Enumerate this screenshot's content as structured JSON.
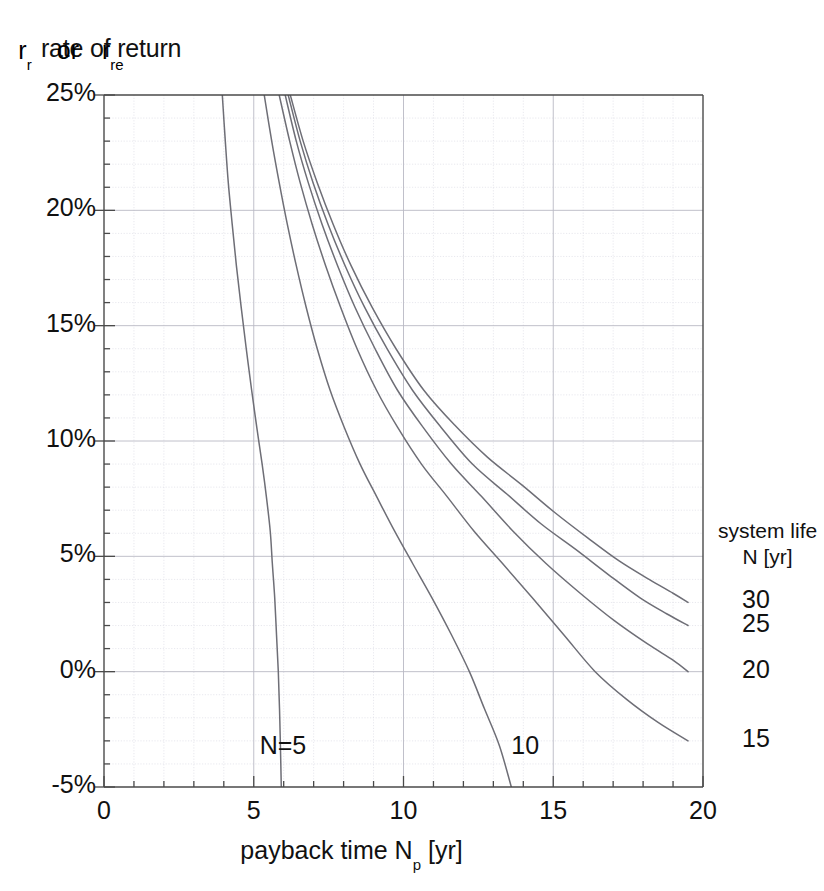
{
  "axes": {
    "ylabel_line1": "rate of return",
    "ylabel_or": "or",
    "ylabel_r": "r",
    "ylabel_r_sub": "r",
    "ylabel_re": "r",
    "ylabel_re_sub": "re",
    "xlabel_main": "payback time N",
    "xlabel_sub": "p",
    "xlabel_unit": " [yr]"
  },
  "legend": {
    "title_line1": "system life",
    "title_line2": "N [yr]",
    "items": [
      {
        "label": "30",
        "y_value": 3.0
      },
      {
        "label": "25",
        "y_value": 2.0
      },
      {
        "label": "20",
        "y_value": 0.0
      },
      {
        "label": "15",
        "y_value": -3.0
      }
    ]
  },
  "curve_labels": [
    {
      "text": "N=5",
      "x": 6.2,
      "y": -3.3
    },
    {
      "text": "10",
      "x": 14.6,
      "y": -3.3
    }
  ],
  "chart_data": {
    "type": "line",
    "title": "",
    "xlabel": "payback time Np [yr]",
    "ylabel": "rate of return rr or rre",
    "xlim": [
      0,
      20
    ],
    "ylim": [
      -5,
      25
    ],
    "xticks": [
      0,
      5,
      10,
      15,
      20
    ],
    "xtick_labels": [
      "0",
      "5",
      "10",
      "15",
      "20"
    ],
    "yticks": [
      -5,
      0,
      5,
      10,
      15,
      20,
      25
    ],
    "ytick_labels": [
      "-5%",
      "0%",
      "5%",
      "10%",
      "15%",
      "20%",
      "25%"
    ],
    "x_minor_step": 1,
    "y_minor_step": 1,
    "grid": true,
    "legend_position": "right-outside",
    "units": {
      "x": "yr",
      "y": "%"
    },
    "series": [
      {
        "name": "5",
        "legend_label": "N=5",
        "points": [
          [
            3.95,
            25.0
          ],
          [
            4.05,
            23.0
          ],
          [
            4.15,
            21.2
          ],
          [
            4.28,
            19.4
          ],
          [
            4.42,
            17.6
          ],
          [
            4.58,
            15.8
          ],
          [
            4.75,
            14.0
          ],
          [
            4.93,
            12.2
          ],
          [
            5.1,
            10.6
          ],
          [
            5.28,
            9.0
          ],
          [
            5.42,
            7.6
          ],
          [
            5.55,
            6.1
          ],
          [
            5.62,
            4.7
          ],
          [
            5.7,
            3.2
          ],
          [
            5.76,
            1.6
          ],
          [
            5.82,
            0.0
          ],
          [
            5.86,
            -1.6
          ],
          [
            5.89,
            -3.2
          ],
          [
            5.92,
            -5.0
          ]
        ]
      },
      {
        "name": "10",
        "legend_label": "10",
        "points": [
          [
            5.35,
            25.0
          ],
          [
            5.6,
            23.0
          ],
          [
            5.85,
            21.2
          ],
          [
            6.12,
            19.4
          ],
          [
            6.42,
            17.6
          ],
          [
            6.75,
            15.8
          ],
          [
            7.12,
            14.0
          ],
          [
            7.55,
            12.2
          ],
          [
            8.02,
            10.6
          ],
          [
            8.55,
            9.0
          ],
          [
            9.1,
            7.6
          ],
          [
            9.7,
            6.1
          ],
          [
            10.3,
            4.7
          ],
          [
            10.95,
            3.2
          ],
          [
            11.6,
            1.6
          ],
          [
            12.2,
            0.0
          ],
          [
            12.7,
            -1.6
          ],
          [
            13.2,
            -3.2
          ],
          [
            13.6,
            -5.0
          ]
        ]
      },
      {
        "name": "15",
        "legend_label": "15",
        "points": [
          [
            5.85,
            25.0
          ],
          [
            6.2,
            23.0
          ],
          [
            6.55,
            21.2
          ],
          [
            6.95,
            19.4
          ],
          [
            7.4,
            17.6
          ],
          [
            7.9,
            15.8
          ],
          [
            8.45,
            14.0
          ],
          [
            9.1,
            12.2
          ],
          [
            9.8,
            10.6
          ],
          [
            10.6,
            9.0
          ],
          [
            11.45,
            7.6
          ],
          [
            12.35,
            6.1
          ],
          [
            13.3,
            4.7
          ],
          [
            14.3,
            3.2
          ],
          [
            15.35,
            1.6
          ],
          [
            16.4,
            0.0
          ],
          [
            17.45,
            -1.2
          ],
          [
            18.5,
            -2.2
          ],
          [
            19.5,
            -3.0
          ]
        ]
      },
      {
        "name": "20",
        "legend_label": "20",
        "points": [
          [
            6.05,
            25.0
          ],
          [
            6.42,
            23.0
          ],
          [
            6.82,
            21.2
          ],
          [
            7.28,
            19.4
          ],
          [
            7.8,
            17.6
          ],
          [
            8.38,
            15.8
          ],
          [
            9.05,
            14.0
          ],
          [
            9.8,
            12.2
          ],
          [
            10.65,
            10.6
          ],
          [
            11.6,
            9.0
          ],
          [
            12.6,
            7.6
          ],
          [
            13.65,
            6.1
          ],
          [
            14.75,
            4.7
          ],
          [
            15.9,
            3.4
          ],
          [
            17.05,
            2.2
          ],
          [
            18.15,
            1.2
          ],
          [
            19.0,
            0.5
          ],
          [
            19.5,
            0.0
          ]
        ]
      },
      {
        "name": "25",
        "legend_label": "25",
        "points": [
          [
            6.15,
            25.0
          ],
          [
            6.55,
            23.0
          ],
          [
            6.98,
            21.2
          ],
          [
            7.48,
            19.4
          ],
          [
            8.05,
            17.6
          ],
          [
            8.7,
            15.8
          ],
          [
            9.45,
            14.0
          ],
          [
            10.3,
            12.2
          ],
          [
            11.25,
            10.6
          ],
          [
            12.3,
            9.0
          ],
          [
            13.45,
            7.7
          ],
          [
            14.6,
            6.4
          ],
          [
            15.75,
            5.3
          ],
          [
            16.85,
            4.2
          ],
          [
            17.9,
            3.2
          ],
          [
            18.8,
            2.5
          ],
          [
            19.5,
            2.0
          ]
        ]
      },
      {
        "name": "30",
        "legend_label": "30",
        "points": [
          [
            6.22,
            25.0
          ],
          [
            6.65,
            23.0
          ],
          [
            7.12,
            21.2
          ],
          [
            7.65,
            19.4
          ],
          [
            8.25,
            17.6
          ],
          [
            8.95,
            15.8
          ],
          [
            9.75,
            14.0
          ],
          [
            10.68,
            12.2
          ],
          [
            11.7,
            10.7
          ],
          [
            12.8,
            9.3
          ],
          [
            13.95,
            8.1
          ],
          [
            15.05,
            6.9
          ],
          [
            16.15,
            5.8
          ],
          [
            17.2,
            4.8
          ],
          [
            18.2,
            4.0
          ],
          [
            19.0,
            3.4
          ],
          [
            19.5,
            3.0
          ]
        ]
      }
    ]
  },
  "plot_geometry": {
    "left": 104,
    "right": 703,
    "top": 95,
    "bottom": 787
  }
}
